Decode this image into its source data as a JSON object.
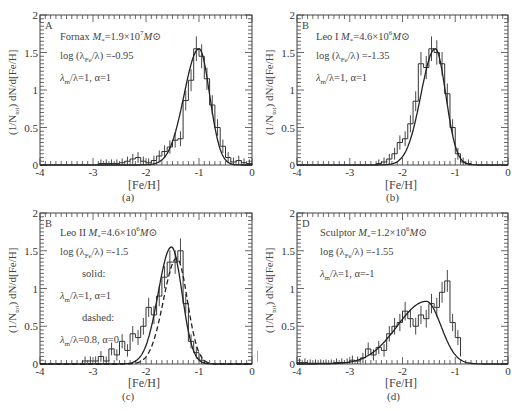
{
  "chart_data": [
    {
      "type": "bar",
      "panel_letter": "A",
      "caption": "(a)",
      "title": "Fornax",
      "legend": [
        "Fornax M*=1.9×10^7 M⊙",
        "log (λFe/λ) =-0.95",
        "λm/λ=1, α=1"
      ],
      "xlabel": "[Fe/H]",
      "ylabel": "(1/Ntot) dN/d[Fe/H]",
      "xlim": [
        -4,
        0
      ],
      "ylim": [
        0,
        2
      ],
      "xticks": [
        "-4",
        "-3",
        "-2",
        "-1",
        "0"
      ],
      "yticks": [
        "0",
        "0.5",
        "1",
        "1.5",
        "2"
      ],
      "bin_edges": [
        -2.9,
        -2.8,
        -2.7,
        -2.6,
        -2.5,
        -2.4,
        -2.3,
        -2.2,
        -2.1,
        -2.0,
        -1.9,
        -1.8,
        -1.7,
        -1.6,
        -1.5,
        -1.4,
        -1.3,
        -1.2,
        -1.1,
        -1.0,
        -0.9,
        -0.8,
        -0.7,
        -0.6,
        -0.5,
        -0.4,
        -0.3,
        -0.2,
        -0.1,
        0.0
      ],
      "values": [
        0.02,
        0.02,
        0.02,
        0.02,
        0.03,
        0.05,
        0.08,
        0.1,
        0.05,
        0.03,
        0.06,
        0.12,
        0.18,
        0.24,
        0.33,
        0.35,
        0.86,
        1.13,
        1.55,
        1.45,
        1.15,
        0.8,
        0.5,
        0.25,
        0.1,
        0.04,
        0.06,
        0.03,
        0.02
      ],
      "model_peak": -1.0,
      "model_peak_value": 1.55,
      "model_sigma_left": 0.28,
      "model_sigma_right": 0.2,
      "grid": false
    },
    {
      "type": "bar",
      "panel_letter": "B",
      "caption": "(b)",
      "title": "Leo I",
      "legend": [
        "Leo I M*=4.6×10^6 M⊙",
        "log (λFe/λ) =-1.35",
        "λm/λ=1, α=1"
      ],
      "xlabel": "[Fe/H]",
      "ylabel": "(1/Ntot) dN/d[Fe/H]",
      "xlim": [
        -4,
        0
      ],
      "ylim": [
        0,
        2
      ],
      "xticks": [
        "-4",
        "-3",
        "-2",
        "-1",
        "0"
      ],
      "yticks": [
        "0",
        "0.5",
        "1",
        "1.5",
        "2"
      ],
      "bin_edges": [
        -2.5,
        -2.4,
        -2.3,
        -2.2,
        -2.1,
        -2.0,
        -1.9,
        -1.8,
        -1.7,
        -1.6,
        -1.5,
        -1.4,
        -1.3,
        -1.2,
        -1.1,
        -1.0,
        -0.9,
        -0.8,
        -0.7
      ],
      "values": [
        0.02,
        0.04,
        0.08,
        0.15,
        0.3,
        0.35,
        0.55,
        0.85,
        1.35,
        1.3,
        1.55,
        1.5,
        1.35,
        0.95,
        0.5,
        0.15,
        0.04,
        0.02
      ],
      "model_peak": -1.38,
      "model_peak_value": 1.55,
      "model_sigma_left": 0.27,
      "model_sigma_right": 0.2,
      "grid": false
    },
    {
      "type": "bar",
      "panel_letter": "B",
      "caption": "(c)",
      "title": "Leo II",
      "legend": [
        "Leo II M*=4.6×10^6 M⊙",
        "log (λFe/λ) =-1.5",
        "solid:",
        "λm/λ=1, α=1",
        "dashed:",
        "λm/λ=0.8, α=0"
      ],
      "xlabel": "[Fe/H]",
      "ylabel": "(1/Ntot) dN/d[Fe/H]",
      "xlim": [
        -4,
        0
      ],
      "ylim": [
        0,
        2
      ],
      "xticks": [
        "-4",
        "-3",
        "-2",
        "-1",
        "0"
      ],
      "yticks": [
        "0",
        "0.5",
        "1",
        "1.5",
        "2"
      ],
      "bin_edges": [
        -3.2,
        -3.1,
        -3.0,
        -2.9,
        -2.8,
        -2.7,
        -2.6,
        -2.5,
        -2.4,
        -2.3,
        -2.2,
        -2.1,
        -2.0,
        -1.9,
        -1.8,
        -1.7,
        -1.6,
        -1.5,
        -1.4,
        -1.3,
        -1.2,
        -1.1,
        -1.0,
        -0.9
      ],
      "values": [
        0.04,
        0.04,
        0.04,
        0.1,
        0.04,
        0.2,
        0.12,
        0.3,
        0.18,
        0.4,
        0.35,
        0.5,
        0.75,
        0.65,
        0.9,
        1.15,
        1.35,
        1.35,
        1.5,
        0.8,
        0.3,
        0.15,
        0.05
      ],
      "series": [
        {
          "name": "solid",
          "peak": -1.52,
          "peak_value": 1.55,
          "sigma_left": 0.25,
          "sigma_right": 0.2
        },
        {
          "name": "dashed",
          "peak": -1.42,
          "peak_value": 1.4,
          "sigma_left": 0.25,
          "sigma_right": 0.2
        }
      ],
      "grid": false
    },
    {
      "type": "bar",
      "panel_letter": "D",
      "caption": "(d)",
      "title": "Sculptor",
      "legend": [
        "Sculptor M*=1.2×10^6 M⊙",
        "log (λFe/λ) =-1.55",
        "λm/λ=1, α=-1"
      ],
      "xlabel": "[Fe/H]",
      "ylabel": "(1/Ntot) dN/d[Fe/H]",
      "xlim": [
        -4,
        0
      ],
      "ylim": [
        0,
        2
      ],
      "xticks": [
        "-4",
        "-3",
        "-2",
        "-1",
        "0"
      ],
      "yticks": [
        "0",
        "0.5",
        "1",
        "1.5",
        "2"
      ],
      "bin_edges": [
        -4.0,
        -3.9,
        -3.8,
        -3.7,
        -3.6,
        -3.5,
        -3.4,
        -3.3,
        -3.2,
        -3.1,
        -3.0,
        -2.9,
        -2.8,
        -2.7,
        -2.6,
        -2.5,
        -2.4,
        -2.3,
        -2.2,
        -2.1,
        -2.0,
        -1.9,
        -1.8,
        -1.7,
        -1.6,
        -1.5,
        -1.4,
        -1.3,
        -1.2,
        -1.1,
        -1.0,
        -0.9
      ],
      "values": [
        0.02,
        0.02,
        0.01,
        0.01,
        0.01,
        0.01,
        0.01,
        0.02,
        0.02,
        0.02,
        0.05,
        0.04,
        0.08,
        0.2,
        0.12,
        0.22,
        0.18,
        0.4,
        0.5,
        0.55,
        0.7,
        0.6,
        0.5,
        0.65,
        0.6,
        0.8,
        0.75,
        0.95,
        1.1,
        0.55,
        0.35,
        0.1
      ],
      "model_peak": -1.55,
      "model_peak_value": 0.83,
      "model_sigma_left": 0.55,
      "model_sigma_right": 0.28,
      "grid": false
    }
  ],
  "panels": [
    {
      "letter": "A",
      "l1_name": "Fornax ",
      "l1_mass": "=1.9×10",
      "l1_exp": "7",
      "l2": "log (λ",
      "l2_sub": "Fe",
      "l2_tail": "/λ) =-0.95",
      "l3": "λ",
      "l3_sub": "m",
      "l3_tail": "/λ=1, α=1",
      "caption": "(a)",
      "xlabel": "[Fe/H]"
    },
    {
      "letter": "B",
      "l1_name": "Leo I ",
      "l1_mass": "=4.6×10",
      "l1_exp": "6",
      "l2": "log (λ",
      "l2_sub": "Fe",
      "l2_tail": "/λ) =-1.35",
      "l3": "λ",
      "l3_sub": "m",
      "l3_tail": "/λ=1, α=1",
      "caption": "(b)",
      "xlabel": "[Fe/H]"
    },
    {
      "letter": "B",
      "l1_name": "Leo II ",
      "l1_mass": "=4.6×10",
      "l1_exp": "6",
      "l2": "log (λ",
      "l2_sub": "Fe",
      "l2_tail": "/λ) =-1.5",
      "solid": "solid:",
      "l3": "λ",
      "l3_sub": "m",
      "l3_tail": "/λ=1, α=1",
      "dashed": "dashed:",
      "l4": "λ",
      "l4_sub": "m",
      "l4_tail": "/λ=0.8, α=0",
      "caption": "(c)",
      "xlabel": "[Fe/H]"
    },
    {
      "letter": "D",
      "l1_name": "Sculptor ",
      "l1_mass": "=1.2×10",
      "l1_exp": "6",
      "l2": "log (λ",
      "l2_sub": "Fe",
      "l2_tail": "/λ) =-1.55",
      "l3": "λ",
      "l3_sub": "m",
      "l3_tail": "/λ=1, α=-1",
      "caption": "(d)",
      "xlabel": "[Fe/H]"
    }
  ],
  "common": {
    "m_symbol": "M",
    "m_sub": "*",
    "msun": "M⊙",
    "ylabel_pre": "(1/N",
    "ylabel_sub": "tot",
    "ylabel_post": ") dN/d[Fe/H]"
  }
}
